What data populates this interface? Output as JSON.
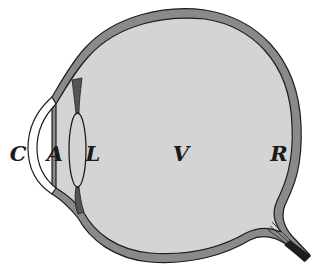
{
  "diagram": {
    "colors": {
      "background": "#ffffff",
      "interior_fill": "#d4d4d4",
      "wall_fill": "#8a8a8a",
      "outline": "#1e1e1e",
      "cornea_fill": "#ffffff"
    },
    "labels": [
      {
        "id": "C",
        "text": "C",
        "meaning": "cornea",
        "x": 18,
        "y": 153
      },
      {
        "id": "A",
        "text": "A",
        "meaning": "aqueous humor",
        "x": 55,
        "y": 153
      },
      {
        "id": "L",
        "text": "L",
        "meaning": "lens",
        "x": 93,
        "y": 153
      },
      {
        "id": "V",
        "text": "V",
        "meaning": "vitreous humor",
        "x": 181,
        "y": 153
      },
      {
        "id": "R",
        "text": "R",
        "meaning": "retina",
        "x": 279,
        "y": 153
      }
    ]
  }
}
